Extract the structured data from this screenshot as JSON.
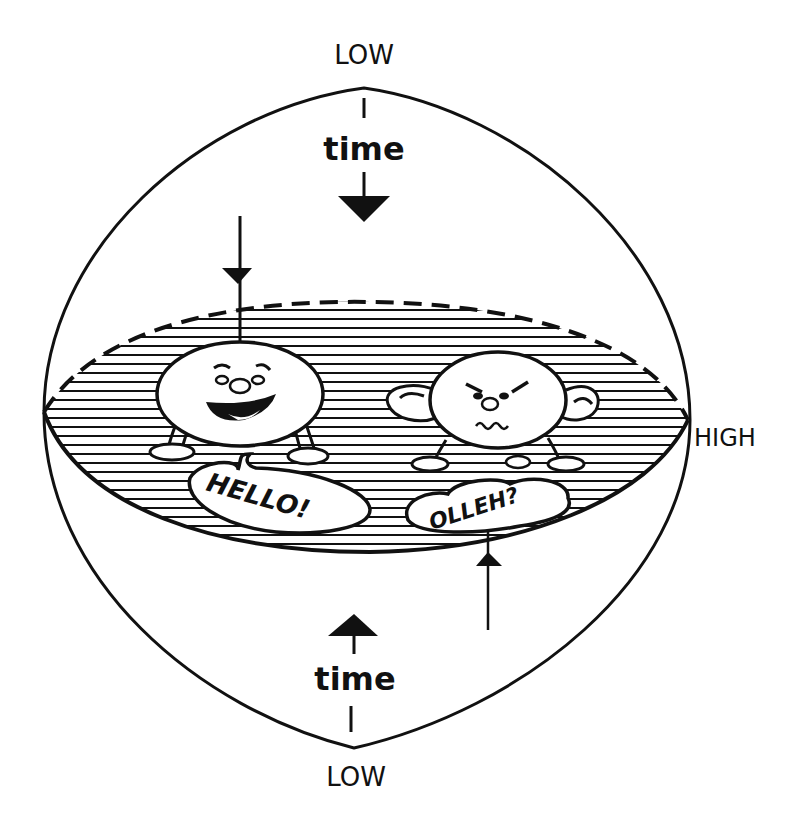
{
  "labels": {
    "top_pole": "LOW",
    "bottom_pole": "LOW",
    "right_edge": "HIGH",
    "time_top": "time",
    "time_bottom": "time"
  },
  "characters": [
    {
      "name": "happy-character",
      "expression": "smiling",
      "speech": "HELLO!"
    },
    {
      "name": "grumpy-character",
      "expression": "frowning",
      "speech": "OLLEH?"
    }
  ],
  "colors": {
    "ink": "#111111",
    "paper": "#ffffff"
  }
}
